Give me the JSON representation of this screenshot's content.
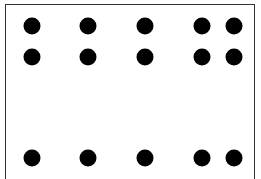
{
  "diagram": {
    "type": "dot-grid",
    "frame_color": "#333333",
    "dot_color": "#000000",
    "dot_diameter": 17,
    "columns_x": [
      32,
      88,
      145,
      202,
      234
    ],
    "rows_y": [
      26,
      57,
      158
    ],
    "dots": [
      {
        "x": 32,
        "y": 26
      },
      {
        "x": 88,
        "y": 26
      },
      {
        "x": 145,
        "y": 26
      },
      {
        "x": 202,
        "y": 26
      },
      {
        "x": 234,
        "y": 26
      },
      {
        "x": 32,
        "y": 57
      },
      {
        "x": 88,
        "y": 57
      },
      {
        "x": 145,
        "y": 57
      },
      {
        "x": 202,
        "y": 57
      },
      {
        "x": 234,
        "y": 57
      },
      {
        "x": 32,
        "y": 158
      },
      {
        "x": 88,
        "y": 158
      },
      {
        "x": 145,
        "y": 158
      },
      {
        "x": 202,
        "y": 158
      },
      {
        "x": 234,
        "y": 158
      }
    ]
  }
}
